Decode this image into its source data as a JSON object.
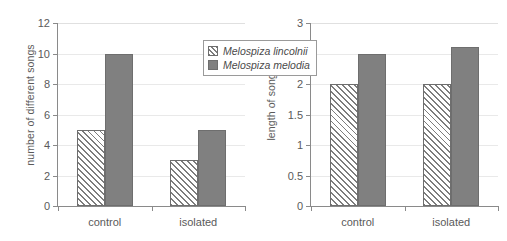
{
  "legend": {
    "position": "top-right-of-left-panel",
    "entries": [
      {
        "label": "Melospiza lincolnii",
        "swatch": "hatched-swatch"
      },
      {
        "label": "Melospiza melodia",
        "swatch": "solid-grey-swatch"
      }
    ]
  },
  "colors": {
    "solid_fill": "#808080",
    "hatch_line": "#7d7d7d",
    "hatch_background": "#f2f2f2",
    "bar_outline": "#6e6e6e",
    "axis": "#8a8a8a",
    "gridline": "#e9e9e9",
    "text": "#5a5a5a"
  },
  "chart_data": [
    {
      "type": "bar",
      "id": "number-of-different-songs",
      "title": "",
      "xlabel": "",
      "ylabel": "number of different songs",
      "categories": [
        "control",
        "isolated"
      ],
      "series": [
        {
          "name": "Melospiza lincolnii",
          "values": [
            5,
            3
          ],
          "fill": "hatched"
        },
        {
          "name": "Melospiza melodia",
          "values": [
            10,
            5
          ],
          "fill": "solid"
        }
      ],
      "ylim": [
        0,
        12
      ],
      "yticks": [
        0,
        2,
        4,
        6,
        8,
        10,
        12
      ],
      "ytick_labels": [
        "0",
        "2",
        "4",
        "6",
        "8",
        "10",
        "12"
      ],
      "grid": true,
      "legend": "top-right"
    },
    {
      "type": "bar",
      "id": "length-of-songs",
      "title": "",
      "xlabel": "",
      "ylabel": "length of songs / s",
      "categories": [
        "control",
        "isolated"
      ],
      "series": [
        {
          "name": "Melospiza lincolnii",
          "values": [
            2,
            2
          ],
          "fill": "hatched"
        },
        {
          "name": "Melospiza melodia",
          "values": [
            2.5,
            2.6
          ],
          "fill": "solid"
        }
      ],
      "ylim": [
        0,
        3
      ],
      "yticks": [
        0,
        0.5,
        1,
        1.5,
        2,
        2.5,
        3
      ],
      "ytick_labels": [
        "0",
        "0.5",
        "1",
        "1.5",
        "2",
        "2.5",
        "3"
      ],
      "grid": true,
      "legend": "none"
    }
  ]
}
